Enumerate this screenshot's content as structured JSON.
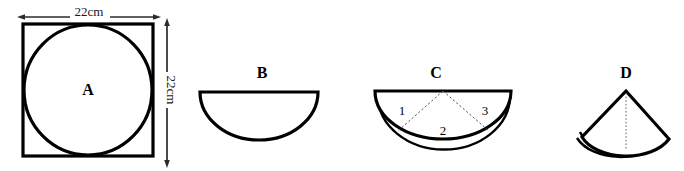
{
  "figure": {
    "title_text": "",
    "background_color": "#ffffff",
    "stroke_color": "#000000",
    "panels": [
      {
        "id": "panel-a",
        "letter": "A",
        "shape": "circle-inscribed-in-square",
        "dimension_top": "22cm",
        "dimension_right": "22cm",
        "dimension_top_arrow": "double-headed-horizontal",
        "dimension_right_arrow": "double-headed-vertical"
      },
      {
        "id": "panel-b",
        "letter": "B",
        "shape": "semicircle-bowl",
        "dimension_top": "",
        "dimension_right": ""
      },
      {
        "id": "panel-c",
        "letter": "C",
        "shape": "semicircle-bowl-divided-in-three-sectors",
        "sector_labels": [
          "1",
          "2",
          "3"
        ]
      },
      {
        "id": "panel-d",
        "letter": "D",
        "shape": "cone-from-sector",
        "center_line": "dotted-vertical-axis"
      }
    ]
  },
  "labels": {
    "a": "A",
    "b": "B",
    "c": "C",
    "d": "D",
    "dim_width": "22cm",
    "dim_height": "22cm",
    "sector_1": "1",
    "sector_2": "2",
    "sector_3": "3"
  }
}
